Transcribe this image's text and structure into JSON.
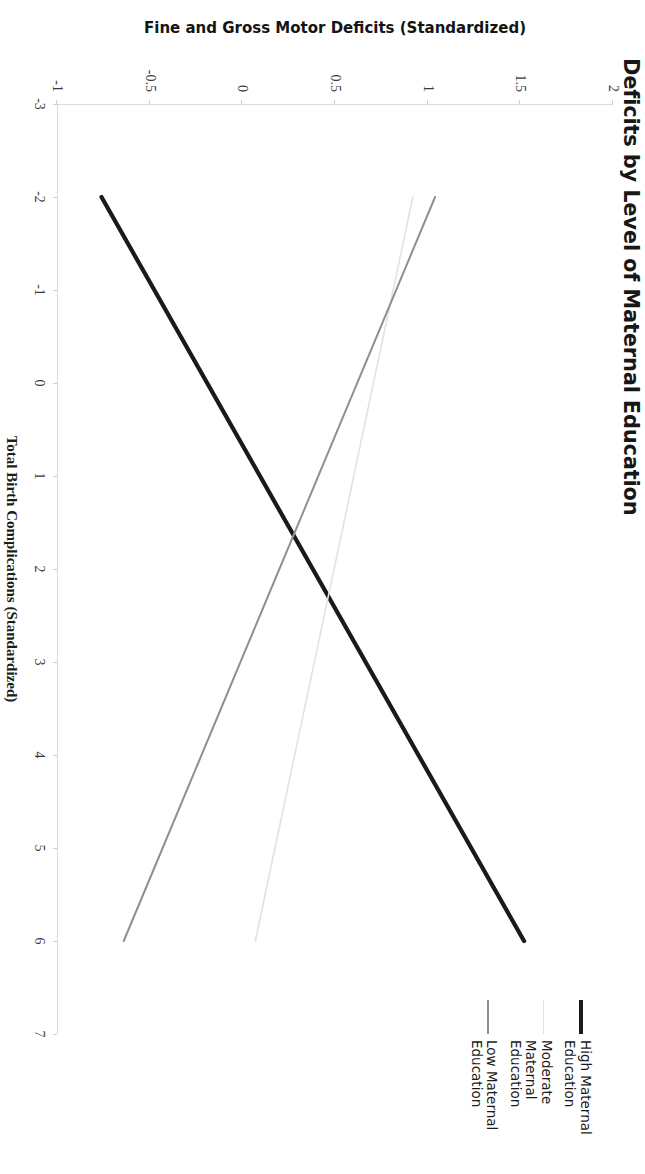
{
  "figure": {
    "title": "Deficits by Level of Maternal Education",
    "background": "#ffffff"
  },
  "chart_data": {
    "type": "line",
    "title": "Deficits by Level of Maternal Education",
    "xlabel": "Total Birth Complications (Standardized)",
    "ylabel": "Fine and Gross Motor Deficits (Standardized)",
    "xlim": [
      -3,
      7
    ],
    "ylim": [
      -1,
      2
    ],
    "xticks": [
      -3,
      -2,
      -1,
      0,
      1,
      2,
      3,
      4,
      5,
      6,
      7
    ],
    "xticklabels": [
      "-3",
      "-2",
      "-1",
      "0",
      "1",
      "2",
      "3",
      "4",
      "5",
      "6",
      "7"
    ],
    "yticks": [
      -1,
      -0.5,
      0,
      0.5,
      1,
      1.5,
      2
    ],
    "yticklabels": [
      "-1",
      "-0.5",
      "0",
      "0.5",
      "1",
      "1.5",
      "2"
    ],
    "grid": false,
    "legend_position": "right",
    "series": [
      {
        "name": "High Maternal Education",
        "color": "#1a1a1a",
        "width": 4.2,
        "style": "solid",
        "x": [
          -2,
          6
        ],
        "y": [
          -0.76,
          1.52
        ]
      },
      {
        "name": "Moderate Maternal Education",
        "color": "#e2e2e2",
        "width": 1.6,
        "style": "solid",
        "x": [
          -2,
          6
        ],
        "y": [
          0.92,
          0.07
        ]
      },
      {
        "name": "Low Maternal Education",
        "color": "#8f8f8f",
        "width": 2.0,
        "style": "solid",
        "x": [
          -2,
          6
        ],
        "y": [
          1.04,
          -0.64
        ]
      }
    ]
  },
  "legend": {
    "items": [
      {
        "label": "High Maternal Education",
        "color": "#1a1a1a",
        "width": 4.2
      },
      {
        "label": "Moderate Maternal Education",
        "color": "#e2e2e2",
        "width": 1.6
      },
      {
        "label": "Low Maternal Education",
        "color": "#8f8f8f",
        "width": 2.0
      }
    ]
  }
}
